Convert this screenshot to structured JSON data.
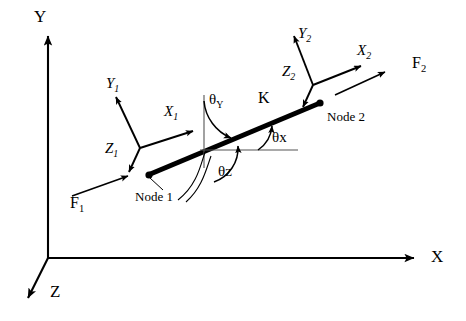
{
  "figure": {
    "type": "engineering-diagram",
    "background_color": "#ffffff",
    "stroke_color": "#000000"
  },
  "global_axes": {
    "origin": {
      "x": 48,
      "y": 258
    },
    "x_label": "X",
    "y_label": "Y",
    "z_label": "Z"
  },
  "beam": {
    "stiffness_label": "K",
    "node1_label": "Node 1",
    "node2_label": "Node 2",
    "node1_point": {
      "x": 148,
      "y": 175
    },
    "node2_point": {
      "x": 320,
      "y": 103
    }
  },
  "local_axes_node1": {
    "x_label": "X",
    "x_sub": "1",
    "y_label": "Y",
    "y_sub": "1",
    "z_label": "Z",
    "z_sub": "1"
  },
  "local_axes_node2": {
    "x_label": "X",
    "x_sub": "2",
    "y_label": "Y",
    "y_sub": "2",
    "z_label": "Z",
    "z_sub": "2"
  },
  "forces": {
    "f1_label": "F",
    "f1_sub": "1",
    "f2_label": "F",
    "f2_sub": "2"
  },
  "angles": {
    "theta_x": "θx",
    "theta_y_symbol": "θ",
    "theta_y_sub": "Y",
    "theta_z": "θz"
  }
}
